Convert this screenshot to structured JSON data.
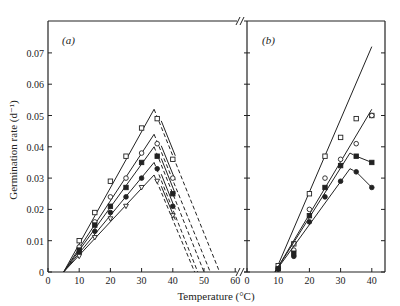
{
  "chart_data": [
    {
      "panel": "(a)",
      "type": "line",
      "title": "",
      "xlabel": "Temperature (°C)",
      "ylabel": "Germination rate (d⁻¹)",
      "xlim": [
        0,
        63
      ],
      "ylim": [
        0,
        0.08
      ],
      "xticks": [
        0,
        10,
        20,
        30,
        40,
        50,
        60
      ],
      "yticks": [
        0,
        0.01,
        0.02,
        0.03,
        0.04,
        0.05,
        0.06,
        0.07
      ],
      "ytick_labels": [
        "0",
        "0.01",
        "0.02",
        "0.03",
        "0.04",
        "0.05",
        "0.06",
        "0.07"
      ],
      "grid": false,
      "series": [
        {
          "name": "open square",
          "marker": "square-open",
          "fit_solid": [
            [
              5,
              0
            ],
            [
              34,
              0.052
            ]
          ],
          "fit_dashed_descent": [
            [
              34,
              0.052
            ],
            [
              55,
              0
            ]
          ],
          "points": [
            [
              10,
              0.01
            ],
            [
              15,
              0.019
            ],
            [
              20,
              0.029
            ],
            [
              25,
              0.037
            ],
            [
              30,
              0.046
            ],
            [
              35,
              0.049
            ],
            [
              40,
              0.036
            ]
          ]
        },
        {
          "name": "open circle",
          "marker": "circle-open",
          "fit_solid": [
            [
              5,
              0
            ],
            [
              34,
              0.044
            ]
          ],
          "fit_dashed_descent": [
            [
              34,
              0.044
            ],
            [
              52,
              0
            ]
          ],
          "points": [
            [
              10,
              0.008
            ],
            [
              15,
              0.016
            ],
            [
              20,
              0.024
            ],
            [
              25,
              0.03
            ],
            [
              30,
              0.038
            ],
            [
              35,
              0.041
            ],
            [
              40,
              0.03
            ]
          ]
        },
        {
          "name": "filled square",
          "marker": "square-filled",
          "fit_solid": [
            [
              5,
              0
            ],
            [
              34,
              0.04
            ]
          ],
          "fit_dashed_descent": [
            [
              34,
              0.04
            ],
            [
              50,
              0
            ]
          ],
          "points": [
            [
              10,
              0.007
            ],
            [
              15,
              0.015
            ],
            [
              20,
              0.021
            ],
            [
              25,
              0.027
            ],
            [
              30,
              0.035
            ],
            [
              35,
              0.037
            ],
            [
              40,
              0.025
            ]
          ]
        },
        {
          "name": "filled circle",
          "marker": "circle-filled",
          "fit_solid": [
            [
              5,
              0
            ],
            [
              34,
              0.035
            ]
          ],
          "fit_dashed_descent": [
            [
              34,
              0.035
            ],
            [
              48,
              0
            ]
          ],
          "points": [
            [
              10,
              0.006
            ],
            [
              15,
              0.013
            ],
            [
              20,
              0.019
            ],
            [
              25,
              0.024
            ],
            [
              30,
              0.03
            ],
            [
              35,
              0.033
            ],
            [
              40,
              0.021
            ]
          ]
        },
        {
          "name": "open triangle",
          "marker": "triangle-open",
          "fit_solid": [
            [
              5,
              0
            ],
            [
              34,
              0.031
            ]
          ],
          "fit_dashed_descent": [
            [
              34,
              0.031
            ],
            [
              47,
              0
            ]
          ],
          "points": [
            [
              10,
              0.005
            ],
            [
              15,
              0.011
            ],
            [
              20,
              0.017
            ],
            [
              25,
              0.021
            ],
            [
              30,
              0.027
            ],
            [
              35,
              0.029
            ],
            [
              40,
              0.018
            ]
          ]
        }
      ],
      "annotations": [
        "(a)"
      ]
    },
    {
      "panel": "(b)",
      "type": "line",
      "xlabel": "Temperature (°C)",
      "xlim": [
        0,
        44
      ],
      "ylim": [
        0,
        0.08
      ],
      "xticks": [
        0,
        10,
        20,
        30,
        40
      ],
      "grid": false,
      "series": [
        {
          "name": "open square",
          "marker": "square-open",
          "fit_solid": [
            [
              9,
              0
            ],
            [
              40,
              0.072
            ]
          ],
          "points": [
            [
              10,
              0.002
            ],
            [
              15,
              0.009
            ],
            [
              20,
              0.025
            ],
            [
              25,
              0.037
            ],
            [
              30,
              0.043
            ],
            [
              35,
              0.049
            ],
            [
              40,
              0.05
            ]
          ]
        },
        {
          "name": "open circle",
          "marker": "circle-open",
          "fit_solid": [
            [
              9,
              0
            ],
            [
              40,
              0.052
            ]
          ],
          "points": [
            [
              10,
              0.001
            ],
            [
              15,
              0.007
            ],
            [
              20,
              0.02
            ],
            [
              25,
              0.03
            ],
            [
              30,
              0.036
            ],
            [
              35,
              0.041
            ],
            [
              40,
              0.05
            ]
          ]
        },
        {
          "name": "filled square",
          "marker": "square-filled",
          "fit_solid": [
            [
              9,
              0
            ],
            [
              33,
              0.038
            ]
          ],
          "fit_dashed": [
            [
              33,
              0.038
            ],
            [
              35,
              0.037
            ]
          ],
          "points": [
            [
              10,
              0.001
            ],
            [
              15,
              0.006
            ],
            [
              20,
              0.018
            ],
            [
              25,
              0.027
            ],
            [
              30,
              0.034
            ],
            [
              35,
              0.037
            ],
            [
              40,
              0.035
            ]
          ]
        },
        {
          "name": "filled circle",
          "marker": "circle-filled",
          "fit_solid": [
            [
              9,
              0
            ],
            [
              33,
              0.033
            ]
          ],
          "fit_dashed": [
            [
              33,
              0.033
            ],
            [
              35,
              0.032
            ]
          ],
          "points": [
            [
              10,
              0.001
            ],
            [
              15,
              0.005
            ],
            [
              20,
              0.016
            ],
            [
              25,
              0.024
            ],
            [
              30,
              0.029
            ],
            [
              35,
              0.032
            ],
            [
              40,
              0.027
            ]
          ]
        }
      ],
      "annotations": [
        "(b)"
      ]
    }
  ],
  "labels": {
    "panel_a": "(a)",
    "panel_b": "(b)",
    "xlabel": "Temperature (°C)",
    "ylabel": "Germination rate (d⁻¹)"
  }
}
